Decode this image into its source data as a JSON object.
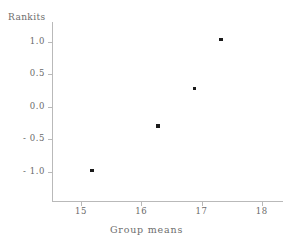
{
  "chart_data": {
    "type": "scatter",
    "title": "",
    "xlabel": "Group means",
    "ylabel": "Rankits",
    "xlim": [
      14.52,
      18.35
    ],
    "ylim": [
      -1.45,
      1.3
    ],
    "grid": false,
    "legend": null,
    "x_ticks": [
      "15",
      "16",
      "17",
      "18"
    ],
    "x_tick_values": [
      15,
      16,
      17,
      18
    ],
    "y_ticks": [
      "1.0",
      "0.5",
      "0.0",
      "- 0.5",
      "- 1.0"
    ],
    "y_tick_values": [
      1.0,
      0.5,
      0.0,
      -0.5,
      -1.0
    ],
    "points": [
      {
        "x": 15.18,
        "y": -0.98
      },
      {
        "x": 16.28,
        "y": -0.3
      },
      {
        "x": 16.88,
        "y": 0.28
      },
      {
        "x": 17.32,
        "y": 1.03
      }
    ],
    "marker_color": "#1b1b1b",
    "axis_color": "#b9b9b9",
    "text_color": "#6a6a6a",
    "background": "#ffffff"
  }
}
